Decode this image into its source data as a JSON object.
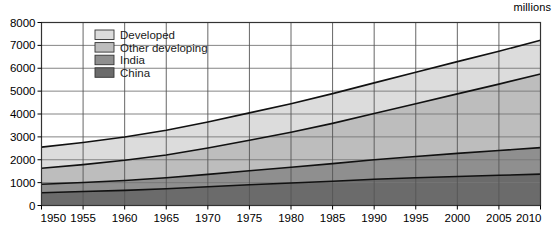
{
  "unit_label": "millions",
  "legend": {
    "items": [
      {
        "label": "Developed",
        "color": "#dcdcdc"
      },
      {
        "label": "Other developing",
        "color": "#bdbdbd"
      },
      {
        "label": "India",
        "color": "#8f8f8f"
      },
      {
        "label": "China",
        "color": "#6b6b6b"
      }
    ]
  },
  "chart_data": {
    "type": "area",
    "stacked": true,
    "title": "",
    "subtitle": "",
    "xlabel": "",
    "ylabel": "millions",
    "xlim": [
      1950,
      2010
    ],
    "ylim": [
      0,
      8000
    ],
    "ytick_step": 1000,
    "xtick_step": 5,
    "grid": true,
    "legend_position": "top-left-inside",
    "categories": [
      1950,
      1955,
      1960,
      1965,
      1970,
      1975,
      1980,
      1985,
      1990,
      1995,
      2000,
      2005,
      2010
    ],
    "xticklabels": [
      "1950",
      "1955",
      "1960",
      "1965",
      "1970",
      "1975",
      "1980",
      "1985",
      "1990",
      "1995",
      "2000",
      "2005",
      "2010"
    ],
    "yticklabels": [
      "0",
      "1000",
      "2000",
      "3000",
      "4000",
      "5000",
      "6000",
      "7000",
      "8000"
    ],
    "series": [
      {
        "name": "China",
        "color": "#6b6b6b",
        "values": [
          560,
          610,
          660,
          730,
          820,
          910,
          985,
          1060,
          1145,
          1215,
          1270,
          1320,
          1370
        ]
      },
      {
        "name": "India",
        "color": "#8f8f8f",
        "values": [
          370,
          395,
          435,
          480,
          540,
          610,
          685,
          770,
          855,
          930,
          1010,
          1085,
          1160
        ]
      },
      {
        "name": "Other developing",
        "color": "#bdbdbd",
        "values": [
          700,
          780,
          880,
          1000,
          1150,
          1330,
          1530,
          1760,
          2020,
          2300,
          2600,
          2900,
          3220
        ]
      },
      {
        "name": "Developed",
        "color": "#dcdcdc",
        "values": [
          920,
          970,
          1020,
          1080,
          1140,
          1200,
          1250,
          1300,
          1340,
          1380,
          1410,
          1440,
          1470
        ]
      }
    ],
    "cumulative_tops": {
      "China": [
        560,
        610,
        660,
        730,
        820,
        910,
        985,
        1060,
        1145,
        1215,
        1270,
        1320,
        1370
      ],
      "India": [
        930,
        1005,
        1095,
        1210,
        1360,
        1520,
        1670,
        1830,
        2000,
        2145,
        2280,
        2405,
        2530
      ],
      "Other developing": [
        1630,
        1785,
        1975,
        2210,
        2510,
        2850,
        3200,
        3590,
        4020,
        4445,
        4880,
        5305,
        5750
      ],
      "Developed": [
        2550,
        2755,
        2995,
        3290,
        3650,
        4050,
        4450,
        4890,
        5360,
        5825,
        6290,
        6745,
        7220
      ]
    }
  }
}
